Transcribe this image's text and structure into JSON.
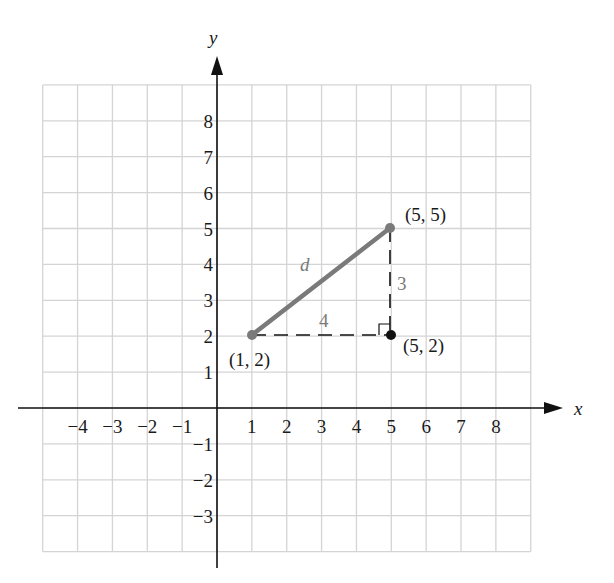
{
  "axes": {
    "x_label": "x",
    "y_label": "y",
    "x_ticks": [
      {
        "value": -4,
        "label": "−4"
      },
      {
        "value": -3,
        "label": "−3"
      },
      {
        "value": -2,
        "label": "−2"
      },
      {
        "value": -1,
        "label": "−1"
      },
      {
        "value": 1,
        "label": "1"
      },
      {
        "value": 2,
        "label": "2"
      },
      {
        "value": 3,
        "label": "3"
      },
      {
        "value": 4,
        "label": "4"
      },
      {
        "value": 5,
        "label": "5"
      },
      {
        "value": 6,
        "label": "6"
      },
      {
        "value": 7,
        "label": "7"
      },
      {
        "value": 8,
        "label": "8"
      }
    ],
    "y_ticks": [
      {
        "value": 8,
        "label": "8"
      },
      {
        "value": 7,
        "label": "7"
      },
      {
        "value": 6,
        "label": "6"
      },
      {
        "value": 5,
        "label": "5"
      },
      {
        "value": 4,
        "label": "4"
      },
      {
        "value": 3,
        "label": "3"
      },
      {
        "value": 2,
        "label": "2"
      },
      {
        "value": 1,
        "label": "1"
      },
      {
        "value": -1,
        "label": "−1"
      },
      {
        "value": -2,
        "label": "−2"
      },
      {
        "value": -3,
        "label": "−3"
      }
    ],
    "grid": {
      "x_min": -5,
      "x_max": 9,
      "y_min": -4,
      "y_max": 9
    }
  },
  "points": [
    {
      "name": "point-1-2",
      "x": 1,
      "y": 2,
      "label": "(1, 2)",
      "color": "#7a7a7a"
    },
    {
      "name": "point-5-5",
      "x": 5,
      "y": 5,
      "label": "(5, 5)",
      "color": "#7a7a7a"
    },
    {
      "name": "point-5-2",
      "x": 5,
      "y": 2,
      "label": "(5, 2)",
      "color": "#111111"
    }
  ],
  "segments": {
    "hypotenuse_label": "d",
    "horizontal_leg_label": "4",
    "vertical_leg_label": "3"
  },
  "colors": {
    "grid": "#d4d4d4",
    "axis": "#111111",
    "hypotenuse": "#7a7a7a",
    "legs": "#111111"
  }
}
